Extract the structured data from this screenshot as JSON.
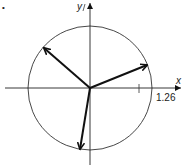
{
  "diagram": {
    "type": "vectors-on-circle",
    "axes": {
      "x_label": "x",
      "y_label": "y"
    },
    "circle": {
      "radius_label": "1.26"
    },
    "tick": {
      "label": "1"
    },
    "vectors": [
      {
        "name": "vector-right-up"
      },
      {
        "name": "vector-left-up"
      },
      {
        "name": "vector-down"
      }
    ],
    "corner_mark": "•"
  }
}
